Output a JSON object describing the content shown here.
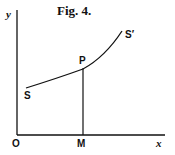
{
  "figure": {
    "title": "Fig. 4.",
    "axes": {
      "x_label": "x",
      "y_label": "y",
      "origin_label": "O"
    },
    "curve": {
      "start_label": "S",
      "end_label": "S′"
    },
    "points": {
      "point_label": "P",
      "foot_label": "M"
    },
    "colors": {
      "ink": "#111111",
      "background": "#ffffff"
    }
  }
}
